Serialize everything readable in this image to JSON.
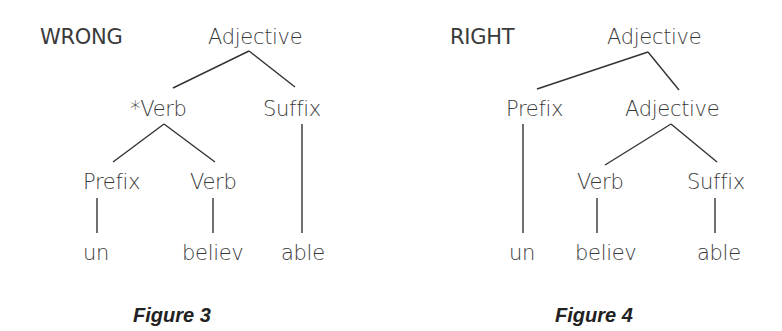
{
  "figures": [
    {
      "label": "WRONG",
      "caption": "Figure 3",
      "nodes": {
        "root": "Adjective",
        "left": "*Verb",
        "right": "Suffix",
        "left_left": "Prefix",
        "left_right": "Verb",
        "leaf1": "un",
        "leaf2": "believ",
        "leaf3": "able"
      }
    },
    {
      "label": "RIGHT",
      "caption": "Figure 4",
      "nodes": {
        "root": "Adjective",
        "left": "Prefix",
        "right": "Adjective",
        "right_left": "Verb",
        "right_right": "Suffix",
        "leaf1": "un",
        "leaf2": "believ",
        "leaf3": "able"
      }
    }
  ]
}
